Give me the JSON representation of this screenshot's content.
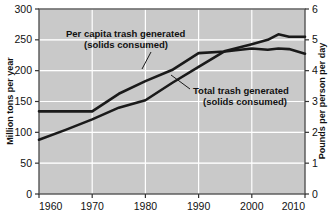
{
  "chart_data": {
    "type": "line",
    "title": "",
    "subtitle": "",
    "xlabel": "",
    "ylabel": "Million tons per year",
    "y2label": "Pounds per person per day",
    "xlim": [
      1960,
      2010
    ],
    "ylim": [
      0,
      300
    ],
    "y2lim": [
      0,
      6
    ],
    "x_ticks": [
      "1960",
      "1970",
      "1980",
      "1990",
      "2000",
      "2010"
    ],
    "x_tick_values": [
      1960,
      1970,
      1980,
      1990,
      2000,
      2010
    ],
    "y_ticks": [
      "0",
      "50",
      "100",
      "150",
      "200",
      "250",
      "300"
    ],
    "y_tick_values": [
      0,
      50,
      100,
      150,
      200,
      250,
      300
    ],
    "y2_ticks": [
      "0",
      "1",
      "2",
      "3",
      "4",
      "5",
      "6"
    ],
    "y2_tick_values": [
      0,
      1,
      2,
      3,
      4,
      5,
      6
    ],
    "grid": true,
    "grid_color": "#ffffff",
    "plot_background": "#c9c9c9",
    "line_color": "#1a1a1a",
    "legend_position": "inline-annotations",
    "series": [
      {
        "name": "Per capita trash generated (solids consumed)",
        "axis": "right",
        "unit": "pounds per person per day",
        "x": [
          1960,
          1965,
          1970,
          1975,
          1980,
          1985,
          1990,
          1995,
          1997,
          2000,
          2003,
          2005,
          2007,
          2010
        ],
        "values": [
          2.68,
          2.68,
          2.68,
          3.25,
          3.66,
          4.02,
          4.57,
          4.62,
          4.66,
          4.72,
          4.68,
          4.72,
          4.7,
          4.55
        ]
      },
      {
        "name": "Total trash generated (solids consumed)",
        "axis": "left",
        "unit": "million tons per year",
        "x": [
          1960,
          1965,
          1970,
          1975,
          1980,
          1985,
          1990,
          1995,
          2000,
          2003,
          2005,
          2007,
          2010
        ],
        "values": [
          88,
          104,
          121,
          140,
          152,
          180,
          206,
          232,
          243,
          250,
          259,
          255,
          255
        ]
      }
    ],
    "annotations": [
      {
        "id": "per-capita-label",
        "line1": "Per capita trash generated",
        "line2": "(solids consumed)",
        "points_to_series": "Per capita trash generated (solids consumed)"
      },
      {
        "id": "total-label",
        "line1": "Total trash generated",
        "line2": "(solids consumed)",
        "points_to_series": "Total trash generated (solids consumed)"
      }
    ]
  }
}
